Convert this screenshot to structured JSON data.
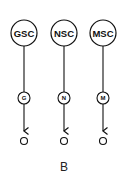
{
  "figure": {
    "panel_label": "B",
    "chains": [
      {
        "source": "GSC",
        "intermediate": "G",
        "target": "O",
        "x": 24
      },
      {
        "source": "NSC",
        "intermediate": "N",
        "target": "O",
        "x": 64
      },
      {
        "source": "MSC",
        "intermediate": "M",
        "target": "O",
        "x": 103
      }
    ]
  }
}
